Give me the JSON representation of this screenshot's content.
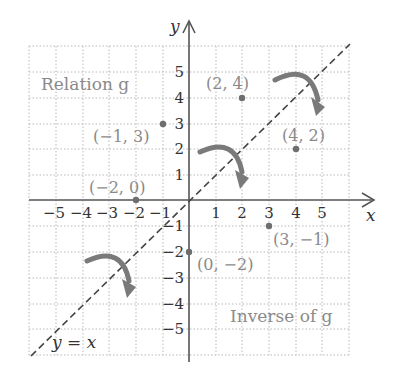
{
  "figure": {
    "axes": {
      "x_label": "x",
      "y_label": "y",
      "x_ticks": [
        "−5",
        "−4",
        "−3",
        "−2",
        "−1",
        "1",
        "2",
        "3",
        "4",
        "5"
      ],
      "y_ticks": [
        "5",
        "4",
        "3",
        "2",
        "1",
        "−1",
        "−2",
        "−3",
        "−4",
        "−5"
      ],
      "range": [
        -6,
        6
      ]
    },
    "regions": {
      "relation_label": "Relation g",
      "inverse_label": "Inverse of g"
    },
    "line": {
      "label": "y = x",
      "style": "dashed"
    },
    "relation_points": [
      {
        "label": "(2, 4)",
        "x": 2,
        "y": 4
      },
      {
        "label": "(−1, 3)",
        "x": -1,
        "y": 3
      },
      {
        "label": "(−2, 0)",
        "x": -2,
        "y": 0
      }
    ],
    "inverse_points": [
      {
        "label": "(4, 2)",
        "x": 4,
        "y": 2
      },
      {
        "label": "(3, −1)",
        "x": 3,
        "y": -1
      },
      {
        "label": "(0, −2)",
        "x": 0,
        "y": -2
      }
    ],
    "colors": {
      "grid": "#b5b5b5",
      "axis": "#555555",
      "point": "#6e6e6e",
      "arrow": "#7a7a7a",
      "label": "#8a8a8a"
    }
  }
}
